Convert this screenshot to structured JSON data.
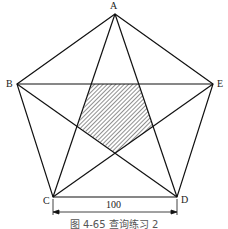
{
  "figure": {
    "caption": "图 4-65  查询练习 2",
    "vertices": {
      "A": "A",
      "B": "B",
      "C": "C",
      "D": "D",
      "E": "E"
    },
    "dimension": {
      "label": "100",
      "from": "C",
      "to": "D"
    },
    "shaded_region": "inner pentagon (hatched)",
    "line_color": "#111111"
  }
}
